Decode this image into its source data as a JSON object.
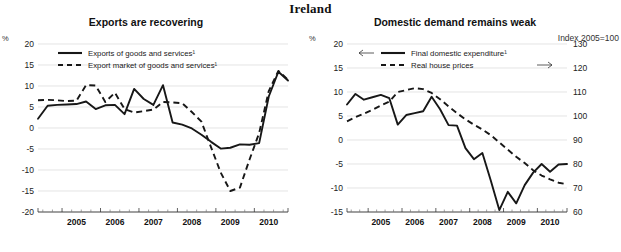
{
  "page": {
    "title": "Ireland"
  },
  "charts": [
    {
      "id": "exports",
      "type": "line",
      "title": "Exports are recovering",
      "ylabel": "%",
      "xlabel": "",
      "ylim": [
        -20,
        20
      ],
      "yticks": [
        20,
        15,
        10,
        5,
        0,
        -5,
        -10,
        -15,
        -20
      ],
      "ytick_labels": [
        "20",
        "15",
        "10",
        "5",
        "0",
        "-5",
        "-10",
        "-15",
        "-20"
      ],
      "xlim": [
        2004.375,
        2010.875
      ],
      "xtick_labels": [
        "2005",
        "2006",
        "2007",
        "2008",
        "2009",
        "2010"
      ],
      "xticks": [
        2005,
        2006,
        2007,
        2008,
        2009,
        2010
      ],
      "grid": true,
      "legend_position": "upper-center",
      "series": [
        {
          "name": "Exports of goods and services¹",
          "style": "solid",
          "x": [
            2004.375,
            2004.625,
            2004.875,
            2005.125,
            2005.375,
            2005.625,
            2005.875,
            2006.125,
            2006.375,
            2006.625,
            2006.875,
            2007.125,
            2007.375,
            2007.625,
            2007.875,
            2008.125,
            2008.375,
            2008.625,
            2008.875,
            2009.125,
            2009.375,
            2009.625,
            2009.875,
            2010.125,
            2010.375,
            2010.625,
            2010.875
          ],
          "values": [
            2.2,
            5.3,
            5.5,
            5.6,
            5.7,
            6.3,
            4.5,
            5.4,
            5.5,
            3.3,
            9.3,
            6.9,
            5.5,
            10.2,
            1.3,
            0.8,
            -0.1,
            -1.6,
            -3.3,
            -4.9,
            -4.7,
            -3.9,
            -4.0,
            -3.6,
            7.5,
            13.4,
            11.3
          ]
        },
        {
          "name": "Export market of goods and services¹",
          "style": "dashed",
          "x": [
            2004.375,
            2004.625,
            2004.875,
            2005.125,
            2005.375,
            2005.625,
            2005.875,
            2006.125,
            2006.375,
            2006.625,
            2006.875,
            2007.125,
            2007.375,
            2007.625,
            2007.875,
            2008.125,
            2008.375,
            2008.625,
            2008.875,
            2009.125,
            2009.375,
            2009.625,
            2009.875,
            2010.125,
            2010.375,
            2010.625,
            2010.875
          ],
          "values": [
            6.6,
            6.7,
            6.6,
            6.4,
            6.5,
            10.2,
            10.1,
            6.2,
            8.4,
            4.5,
            3.7,
            4.0,
            4.4,
            6.2,
            6.1,
            5.9,
            3.8,
            1.5,
            -4.6,
            -10.6,
            -15.0,
            -14.2,
            -7.5,
            -1.2,
            8.8,
            13.6,
            11.5
          ]
        }
      ]
    },
    {
      "id": "domestic-demand",
      "type": "line",
      "title": "Domestic demand remains weak",
      "ylabel": "%",
      "y2label": "Index 2005=100",
      "xlabel": "",
      "ylim": [
        -15,
        20
      ],
      "yticks": [
        20,
        15,
        10,
        5,
        0,
        -5,
        -10,
        -15
      ],
      "ytick_labels": [
        "20",
        "15",
        "10",
        "5",
        "0",
        "-5",
        "-10",
        "-15"
      ],
      "y2lim": [
        60,
        130
      ],
      "y2ticks": [
        130,
        120,
        110,
        100,
        90,
        80,
        70,
        60
      ],
      "y2tick_labels": [
        "130",
        "120",
        "110",
        "100",
        "90",
        "80",
        "70",
        "60"
      ],
      "xlim": [
        2004.375,
        2010.875
      ],
      "xtick_labels": [
        "2005",
        "2006",
        "2007",
        "2008",
        "2009",
        "2010"
      ],
      "xticks": [
        2005,
        2006,
        2007,
        2008,
        2009,
        2010
      ],
      "grid": true,
      "legend_position": "upper-center",
      "series": [
        {
          "name": "Final domestic expenditure¹",
          "style": "solid",
          "axis": "left",
          "arrow": "left",
          "x": [
            2004.375,
            2004.625,
            2004.875,
            2005.125,
            2005.375,
            2005.625,
            2005.875,
            2006.125,
            2006.375,
            2006.625,
            2006.875,
            2007.125,
            2007.375,
            2007.625,
            2007.875,
            2008.125,
            2008.375,
            2008.625,
            2008.875,
            2009.125,
            2009.375,
            2009.625,
            2009.875,
            2010.125,
            2010.375,
            2010.625,
            2010.875
          ],
          "values": [
            7.4,
            9.6,
            8.4,
            8.9,
            9.4,
            8.7,
            3.2,
            5.2,
            5.6,
            6.0,
            9.0,
            6.4,
            3.1,
            3.0,
            -1.7,
            -4.0,
            -2.7,
            -8.5,
            -14.6,
            -10.8,
            -13.2,
            -9.4,
            -6.8,
            -5.0,
            -6.6,
            -5.1,
            -5.0
          ]
        },
        {
          "name": "Real house prices",
          "style": "dashed",
          "axis": "right",
          "arrow": "right",
          "x": [
            2004.375,
            2004.625,
            2004.875,
            2005.125,
            2005.375,
            2005.625,
            2005.875,
            2006.125,
            2006.375,
            2006.625,
            2006.875,
            2007.125,
            2007.375,
            2007.625,
            2007.875,
            2008.125,
            2008.375,
            2008.625,
            2008.875,
            2009.125,
            2009.375,
            2009.625,
            2009.875,
            2010.125,
            2010.375,
            2010.625,
            2010.875
          ],
          "values": [
            97.8,
            99.5,
            101.0,
            102.6,
            104.4,
            106.0,
            110.0,
            110.8,
            111.6,
            111.2,
            109.6,
            107.0,
            104.0,
            101.2,
            98.6,
            96.4,
            94.4,
            92.0,
            89.0,
            86.0,
            83.0,
            80.4,
            77.4,
            75.2,
            73.6,
            72.2,
            71.6
          ]
        }
      ]
    }
  ]
}
